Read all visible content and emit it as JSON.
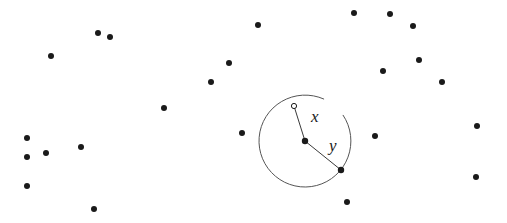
{
  "figure": {
    "name": "poisson-point-process-circle-diagram",
    "width": 507,
    "height": 223,
    "background_color": "#ffffff",
    "dot_color": "#1a1a1a",
    "stroke_color": "#555555",
    "labels": {
      "x": "x",
      "y": "y"
    }
  },
  "chart_data": {
    "type": "scatter",
    "title": "",
    "subtitle": "",
    "xlabel": "",
    "ylabel": "",
    "grid": false,
    "legend": null,
    "xlim": [
      0,
      507
    ],
    "ylim": [
      0,
      223
    ],
    "note": "Scattered points (a planar point pattern) with one distinguished centre point; a circle is drawn about the centre. Segment labelled x joins the centre to an open (hollow) point inside the circle; segment labelled y joins the centre to a filled point on the circle boundary.",
    "series": [
      {
        "name": "filled-points",
        "marker": "filled-circle",
        "color": "#1a1a1a",
        "radius": 3,
        "points": [
          [
            98,
            33
          ],
          [
            110,
            37
          ],
          [
            51,
            56
          ],
          [
            27,
            138
          ],
          [
            27,
            157
          ],
          [
            46,
            153
          ],
          [
            81,
            147
          ],
          [
            27,
            186
          ],
          [
            94,
            209
          ],
          [
            164,
            108
          ],
          [
            211,
            82
          ],
          [
            229,
            63
          ],
          [
            258,
            25
          ],
          [
            242,
            133
          ],
          [
            354,
            13
          ],
          [
            390,
            14
          ],
          [
            413,
            26
          ],
          [
            419,
            60
          ],
          [
            383,
            71
          ],
          [
            442,
            82
          ],
          [
            477,
            126
          ],
          [
            476,
            177
          ],
          [
            347,
            202
          ],
          [
            375,
            136
          ]
        ]
      },
      {
        "name": "centre-point",
        "marker": "filled-circle",
        "color": "#1a1a1a",
        "radius": 3.2,
        "points": [
          [
            305,
            141
          ]
        ]
      },
      {
        "name": "boundary-point",
        "marker": "filled-circle",
        "color": "#1a1a1a",
        "radius": 3.2,
        "points": [
          [
            341,
            170
          ]
        ]
      },
      {
        "name": "open-point",
        "marker": "open-circle",
        "color": "#1a1a1a",
        "radius": 2.6,
        "points": [
          [
            294,
            106
          ]
        ]
      }
    ],
    "circle": {
      "name": "reference-circle",
      "center": [
        305,
        141
      ],
      "radius": 46,
      "stroke": "#555555",
      "stroke_width": 1,
      "fill": "none",
      "gap_start_deg": -66,
      "gap_end_deg": -34
    },
    "segments": [
      {
        "name": "segment-x",
        "label": "x",
        "from": [
          305,
          141
        ],
        "to": [
          294,
          106
        ],
        "stroke": "#3a3a3a",
        "stroke_width": 1
      },
      {
        "name": "segment-y",
        "label": "y",
        "from": [
          305,
          141
        ],
        "to": [
          341,
          170
        ],
        "stroke": "#3a3a3a",
        "stroke_width": 1
      }
    ],
    "annotations": [
      {
        "name": "label-x",
        "text": "x",
        "position": [
          311,
          122
        ],
        "style": "italic-serif"
      },
      {
        "name": "label-y",
        "text": "y",
        "position": [
          329,
          151
        ],
        "style": "italic-serif"
      }
    ]
  }
}
